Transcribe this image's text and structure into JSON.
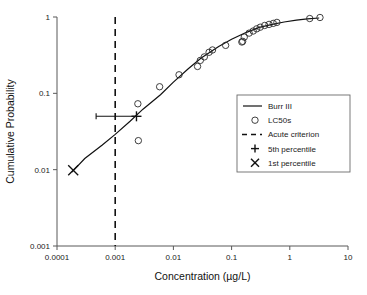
{
  "chart_data": {
    "type": "scatter",
    "title": "",
    "xlabel": "Concentration (µg/L)",
    "ylabel": "Cumulative Probability",
    "xscale": "log",
    "yscale": "log",
    "xlim": [
      0.0001,
      10
    ],
    "ylim": [
      0.001,
      1
    ],
    "grid": false,
    "xticks": [
      "0.0001",
      "0.001",
      "0.01",
      "0.1",
      "1",
      "10"
    ],
    "xtick_values": [
      0.0001,
      0.001,
      0.01,
      0.1,
      1,
      10
    ],
    "yticks": [
      "0.001",
      "0.01",
      "0.1",
      "1"
    ],
    "ytick_values": [
      0.001,
      0.01,
      0.1,
      1
    ],
    "legend_position": "right-middle",
    "series": [
      {
        "name": "Burr III",
        "type": "line",
        "x": [
          0.00018,
          0.0003,
          0.0006,
          0.001,
          0.0018,
          0.003,
          0.006,
          0.01,
          0.018,
          0.03,
          0.06,
          0.1,
          0.18,
          0.3,
          0.5,
          0.8,
          1.3,
          2.0,
          3.2
        ],
        "y": [
          0.0093,
          0.014,
          0.021,
          0.029,
          0.043,
          0.062,
          0.096,
          0.14,
          0.21,
          0.29,
          0.41,
          0.51,
          0.63,
          0.73,
          0.8,
          0.86,
          0.91,
          0.945,
          0.97
        ]
      },
      {
        "name": "LC50s",
        "type": "scatter",
        "x": [
          0.00245,
          0.0025,
          0.0058,
          0.0125,
          0.026,
          0.029,
          0.034,
          0.041,
          0.047,
          0.079,
          0.15,
          0.155,
          0.165,
          0.2,
          0.235,
          0.27,
          0.31,
          0.37,
          0.44,
          0.52,
          0.6,
          2.2,
          3.3
        ],
        "y": [
          0.073,
          0.024,
          0.122,
          0.175,
          0.225,
          0.27,
          0.3,
          0.345,
          0.37,
          0.425,
          0.47,
          0.48,
          0.545,
          0.615,
          0.655,
          0.7,
          0.735,
          0.775,
          0.8,
          0.825,
          0.85,
          0.955,
          0.985
        ]
      },
      {
        "name": "Acute criterion",
        "type": "vline",
        "x": 0.001
      },
      {
        "name": "5th percentile",
        "type": "marker-plus",
        "x": 0.00232,
        "y": 0.05,
        "xerr_low": 0.00047,
        "xerr_high": 0.00232
      },
      {
        "name": "1st percentile",
        "type": "marker-x",
        "x": 0.00019,
        "y": 0.0098
      }
    ]
  },
  "legend": {
    "items": [
      {
        "label": "Burr III",
        "glyph": "line"
      },
      {
        "label": "LC50s",
        "glyph": "circle"
      },
      {
        "label": "Acute criterion",
        "glyph": "dash"
      },
      {
        "label": "5th percentile",
        "glyph": "plus"
      },
      {
        "label": "1st percentile",
        "glyph": "cross"
      }
    ]
  },
  "colors": {
    "line": "#111111",
    "marker": "#2b2b2b",
    "axis": "#595959",
    "text": "#1a1a1a",
    "background": "#ffffff"
  }
}
